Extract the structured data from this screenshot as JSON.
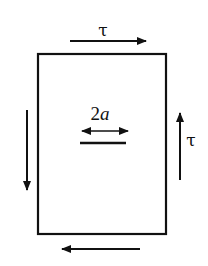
{
  "diagram": {
    "stroke_color": "#111111",
    "background": "#ffffff",
    "labels": {
      "top_shear": "τ",
      "right_shear": "τ",
      "crack_length_prefix": "2",
      "crack_length_var": "a"
    },
    "plate": {
      "x": 38,
      "y": 54,
      "width": 128,
      "height": 180
    },
    "arrows": {
      "top": {
        "direction": "right",
        "x1": 70,
        "y1": 41,
        "x2": 146,
        "y2": 41
      },
      "bottom": {
        "direction": "left",
        "x1": 140,
        "y1": 249,
        "x2": 62,
        "y2": 249
      },
      "right": {
        "direction": "up",
        "x1": 180,
        "y1": 180,
        "x2": 180,
        "y2": 113
      },
      "left": {
        "direction": "down",
        "x1": 27,
        "y1": 110,
        "x2": 27,
        "y2": 190
      },
      "crack_dimension": {
        "direction": "both",
        "x1": 82,
        "y1": 131,
        "x2": 128,
        "y2": 131
      }
    },
    "crack": {
      "x1": 80,
      "y1": 143,
      "x2": 126,
      "y2": 143
    }
  }
}
